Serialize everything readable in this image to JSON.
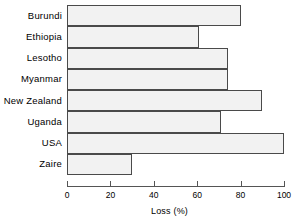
{
  "chart_data": {
    "type": "bar",
    "orientation": "horizontal",
    "title": "",
    "xlabel": "Loss (%)",
    "ylabel": "",
    "categories": [
      "Burundi",
      "Ethiopia",
      "Lesotho",
      "Myanmar",
      "New Zealand",
      "Uganda",
      "USA",
      "Zaire"
    ],
    "values": [
      80,
      61,
      74,
      74,
      90,
      71,
      100,
      30
    ],
    "xlim": [
      0,
      100
    ],
    "xticks": [
      0,
      20,
      40,
      60,
      80,
      100
    ],
    "xtick_labels": [
      "0",
      "20",
      "40",
      "60",
      "80",
      "100"
    ],
    "grid": false,
    "legend": false,
    "bar_fill_color": "#f2f2f2",
    "bar_edge_color": "#4a4a4a",
    "background_color": "#ffffff"
  }
}
